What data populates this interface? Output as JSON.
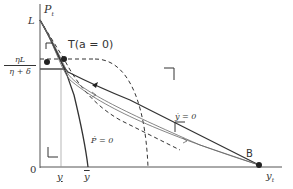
{
  "diagram": {
    "axes": {
      "y_label": "P",
      "y_label_sub": "t",
      "x_label": "y",
      "x_label_sub": "t",
      "origin": "0"
    },
    "y_ticks": {
      "L": "L",
      "level_num": "ηL",
      "level_den": "η + δ"
    },
    "x_ticks": {
      "y_under": "y",
      "y_over": "y"
    },
    "points": {
      "T": "T(a = 0)",
      "B": "B"
    },
    "loci": {
      "ydot": "ẏ = 0",
      "pdot": "Ṗ = 0"
    },
    "colors": {
      "line": "#333333",
      "thin": "#666666",
      "axis": "#555555"
    }
  }
}
